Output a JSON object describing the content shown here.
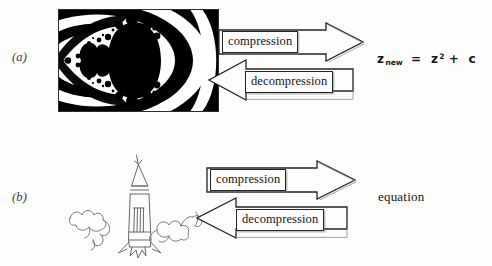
{
  "figure": {
    "background_color": "#fdfdfd",
    "ink_color": "#1a1a1a"
  },
  "panels": [
    {
      "id": "a",
      "label": "(a)",
      "source_graphic": "mandelbrot-fractal-image",
      "source_caption": "black and white Mandelbrot set fractal image",
      "forward_arrow_label": "compression",
      "reverse_arrow_label": "decompression",
      "output_kind": "equation",
      "equation": {
        "full_text": "z_new = z^2 + c",
        "base": "z",
        "subscript": "new",
        "equals": "=",
        "term_base": "z",
        "term_exponent": "2",
        "plus": "+",
        "constant": "c"
      }
    },
    {
      "id": "b",
      "label": "(b)",
      "source_graphic": "rocket-launch-line-drawing",
      "source_caption": "hand drawn rocket lifting off with smoke clouds",
      "forward_arrow_label": "compression",
      "reverse_arrow_label": "decompression",
      "output_kind": "word",
      "output_text": "equation"
    }
  ]
}
